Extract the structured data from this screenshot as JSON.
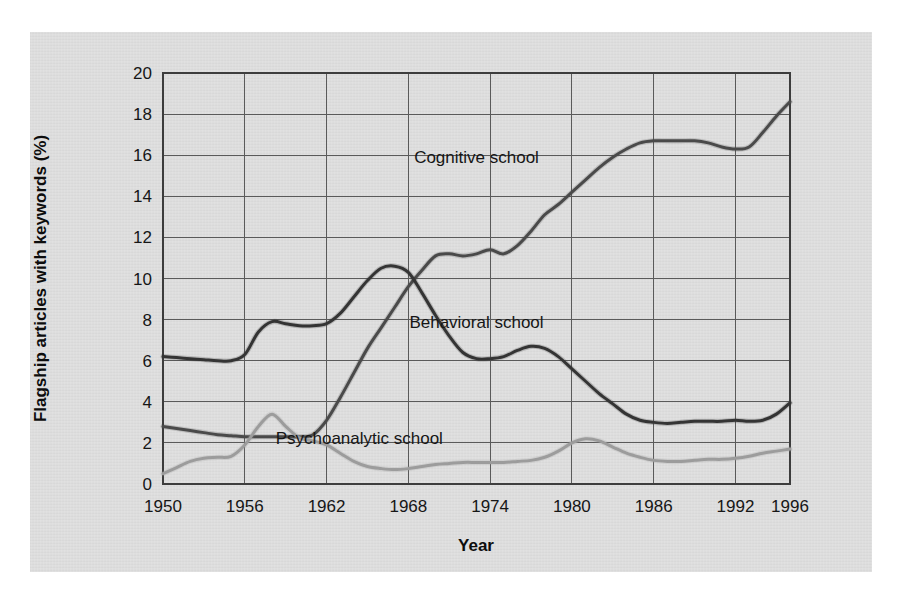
{
  "chart_data": {
    "type": "line",
    "title": "",
    "xlabel": "Year",
    "ylabel": "Flagship articles with keywords (%)",
    "xlim": [
      1950,
      1996
    ],
    "ylim": [
      0,
      20
    ],
    "grid": true,
    "legend_position": "inline-annotations",
    "xticks": [
      "1950",
      "1956",
      "1962",
      "1968",
      "1974",
      "1980",
      "1986",
      "1992",
      "1996"
    ],
    "xtick_values": [
      1950,
      1956,
      1962,
      1968,
      1974,
      1980,
      1986,
      1992,
      1996
    ],
    "yticks": [
      "0",
      "2",
      "4",
      "6",
      "8",
      "10",
      "12",
      "14",
      "16",
      "18",
      "20"
    ],
    "ytick_values": [
      0,
      2,
      4,
      6,
      8,
      10,
      12,
      14,
      16,
      18,
      20
    ],
    "x": [
      1950,
      1951,
      1952,
      1953,
      1954,
      1955,
      1956,
      1957,
      1958,
      1959,
      1960,
      1961,
      1962,
      1963,
      1964,
      1965,
      1966,
      1967,
      1968,
      1969,
      1970,
      1971,
      1972,
      1973,
      1974,
      1975,
      1976,
      1977,
      1978,
      1979,
      1980,
      1981,
      1982,
      1983,
      1984,
      1985,
      1986,
      1987,
      1988,
      1989,
      1990,
      1991,
      1992,
      1993,
      1994,
      1995,
      1996
    ],
    "series": [
      {
        "name": "Cognitive school",
        "color": "#4a4a4a",
        "values": [
          2.8,
          2.7,
          2.6,
          2.5,
          2.4,
          2.35,
          2.3,
          2.3,
          2.3,
          2.3,
          2.3,
          2.4,
          3.1,
          4.2,
          5.4,
          6.6,
          7.6,
          8.6,
          9.6,
          10.4,
          11.1,
          11.2,
          11.1,
          11.2,
          11.4,
          11.2,
          11.6,
          12.3,
          13.1,
          13.6,
          14.2,
          14.8,
          15.4,
          15.9,
          16.3,
          16.6,
          16.7,
          16.7,
          16.7,
          16.7,
          16.6,
          16.4,
          16.3,
          16.4,
          17.1,
          17.9,
          18.6
        ]
      },
      {
        "name": "Behavioral school",
        "color": "#343434",
        "values": [
          6.2,
          6.15,
          6.1,
          6.05,
          6.0,
          6.0,
          6.3,
          7.4,
          7.9,
          7.8,
          7.7,
          7.7,
          7.8,
          8.3,
          9.1,
          9.9,
          10.5,
          10.6,
          10.3,
          9.3,
          8.2,
          7.2,
          6.4,
          6.1,
          6.1,
          6.2,
          6.5,
          6.7,
          6.6,
          6.2,
          5.6,
          5.0,
          4.4,
          3.9,
          3.4,
          3.1,
          3.0,
          2.95,
          3.0,
          3.05,
          3.05,
          3.05,
          3.1,
          3.05,
          3.1,
          3.4,
          3.95
        ]
      },
      {
        "name": "Psychoanalytic school",
        "color": "#9c9c9c",
        "values": [
          0.5,
          0.8,
          1.1,
          1.25,
          1.3,
          1.35,
          1.9,
          2.8,
          3.4,
          2.8,
          2.25,
          2.1,
          1.9,
          1.5,
          1.1,
          0.85,
          0.75,
          0.7,
          0.75,
          0.85,
          0.95,
          1.0,
          1.05,
          1.05,
          1.05,
          1.05,
          1.1,
          1.15,
          1.3,
          1.6,
          2.0,
          2.2,
          2.1,
          1.8,
          1.5,
          1.3,
          1.15,
          1.1,
          1.1,
          1.15,
          1.2,
          1.2,
          1.25,
          1.35,
          1.5,
          1.6,
          1.7
        ]
      }
    ],
    "annotations": [
      {
        "text": "Cognitive school",
        "x": 1973.0,
        "y": 15.6
      },
      {
        "text": "Behavioral school",
        "x": 1973.0,
        "y": 7.6
      },
      {
        "text": "Psychoanalytic school",
        "x": 1964.4,
        "y": 1.95
      }
    ]
  },
  "colors": {
    "panel_background": "#dcdcdc",
    "page_background": "#ffffff",
    "gridline": "#5a5a5a",
    "frame": "#3d3d3d",
    "text": "#161616"
  }
}
